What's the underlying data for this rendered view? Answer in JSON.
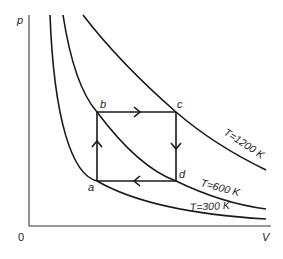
{
  "diagram": {
    "axes": {
      "y_label": "p",
      "x_label": "V",
      "origin_label": "0",
      "color": "#777777"
    },
    "isotherms": [
      {
        "id": "t300",
        "label": "T=300 K",
        "temperature_K": 300
      },
      {
        "id": "t600",
        "label": "T=600 K",
        "temperature_K": 600
      },
      {
        "id": "t1200",
        "label": "T=1200 K",
        "temperature_K": 1200
      }
    ],
    "cycle": {
      "points": [
        {
          "id": "a",
          "label": "a",
          "isotherm_K": 300
        },
        {
          "id": "b",
          "label": "b",
          "isotherm_K": 600
        },
        {
          "id": "c",
          "label": "c",
          "isotherm_K": 1200
        },
        {
          "id": "d",
          "label": "d",
          "isotherm_K": 600
        }
      ],
      "path": [
        "a",
        "b",
        "c",
        "d",
        "a"
      ],
      "direction": "clockwise"
    },
    "line_color": "#1a1a1a"
  }
}
